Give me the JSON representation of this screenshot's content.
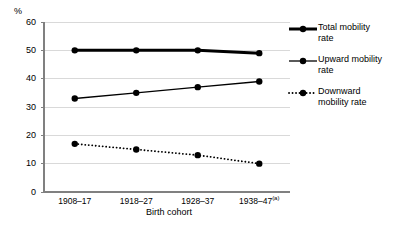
{
  "chart_data": {
    "type": "line",
    "title": "",
    "xlabel": "Birth cohort",
    "ylabel": "%",
    "ylim": [
      0,
      60
    ],
    "ytick_step": 10,
    "yticks": [
      "60",
      "50",
      "40",
      "30",
      "20",
      "10",
      "0"
    ],
    "grid": true,
    "legend_position": "right",
    "categories": [
      "1908–17",
      "1918–27",
      "1928–37",
      "1938–47"
    ],
    "category_notes": [
      "",
      "",
      "",
      "(a)"
    ],
    "series": [
      {
        "name": "Total mobility rate",
        "values": [
          50,
          50,
          50,
          49
        ],
        "line_style": "solid",
        "line_width": 3,
        "color": "#000000",
        "marker": "circle"
      },
      {
        "name": "Upward mobility rate",
        "values": [
          33,
          35,
          37,
          39
        ],
        "line_style": "solid",
        "line_width": 1.3,
        "color": "#000000",
        "marker": "circle"
      },
      {
        "name": "Downward mobility rate",
        "values": [
          17,
          15,
          13,
          10
        ],
        "line_style": "dotted",
        "line_width": 1.8,
        "color": "#000000",
        "marker": "circle"
      }
    ]
  },
  "legend": {
    "entries": [
      {
        "label_line1": "Total mobility",
        "label_line2": "rate"
      },
      {
        "label_line1": "Upward mobility",
        "label_line2": "rate"
      },
      {
        "label_line1": "Downward",
        "label_line2": "mobility rate"
      }
    ]
  },
  "axis": {
    "y_unit": "%",
    "x_title": "Birth cohort"
  },
  "colors": {
    "axis": "#808080",
    "grid": "#d9d9d9",
    "series": "#000000",
    "background": "#ffffff"
  }
}
